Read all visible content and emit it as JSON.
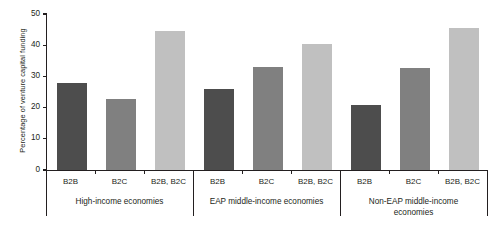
{
  "chart_data": {
    "type": "bar",
    "title": "",
    "subtitle": "",
    "xlabel": "",
    "ylabel": "Percentage of venture capital funding",
    "ylim": [
      0,
      50
    ],
    "yticks": [
      0,
      10,
      20,
      30,
      40,
      50
    ],
    "ytick_labels": [
      "0",
      "10",
      "20",
      "30",
      "40",
      "50"
    ],
    "grid": false,
    "legend": "none",
    "categories": [
      "B2B",
      "B2C",
      "B2B, B2C"
    ],
    "groups": [
      {
        "label": "High-income economies",
        "label_lines": [
          "High-income economies"
        ],
        "bars": [
          {
            "category": "B2B",
            "value": 28.0,
            "color": "#4d4d4d"
          },
          {
            "category": "B2C",
            "value": 22.8,
            "color": "#808080"
          },
          {
            "category": "B2B, B2C",
            "value": 44.6,
            "color": "#c0c0c0"
          }
        ]
      },
      {
        "label": "EAP middle-income economies",
        "label_lines": [
          "EAP middle-income economies"
        ],
        "bars": [
          {
            "category": "B2B",
            "value": 26.0,
            "color": "#4d4d4d"
          },
          {
            "category": "B2C",
            "value": 33.0,
            "color": "#808080"
          },
          {
            "category": "B2B, B2C",
            "value": 40.4,
            "color": "#c0c0c0"
          }
        ]
      },
      {
        "label": "Non-EAP middle-income economies",
        "label_lines": [
          "Non-EAP middle-income",
          "economies"
        ],
        "bars": [
          {
            "category": "B2B",
            "value": 20.8,
            "color": "#4d4d4d"
          },
          {
            "category": "B2C",
            "value": 32.6,
            "color": "#808080"
          },
          {
            "category": "B2B, B2C",
            "value": 45.6,
            "color": "#c0c0c0"
          }
        ]
      }
    ],
    "series": [
      {
        "name": "B2B",
        "color": "#4d4d4d",
        "values": [
          28.0,
          26.0,
          20.8
        ]
      },
      {
        "name": "B2C",
        "color": "#808080",
        "values": [
          22.8,
          33.0,
          32.6
        ]
      },
      {
        "name": "B2B, B2C",
        "color": "#c0c0c0",
        "values": [
          44.6,
          40.4,
          45.6
        ]
      }
    ]
  },
  "colors": {
    "axis": "#231f20",
    "text": "#231f20",
    "background": "#ffffff",
    "bar_b2b": "#4d4d4d",
    "bar_b2c": "#808080",
    "bar_both": "#c0c0c0"
  }
}
